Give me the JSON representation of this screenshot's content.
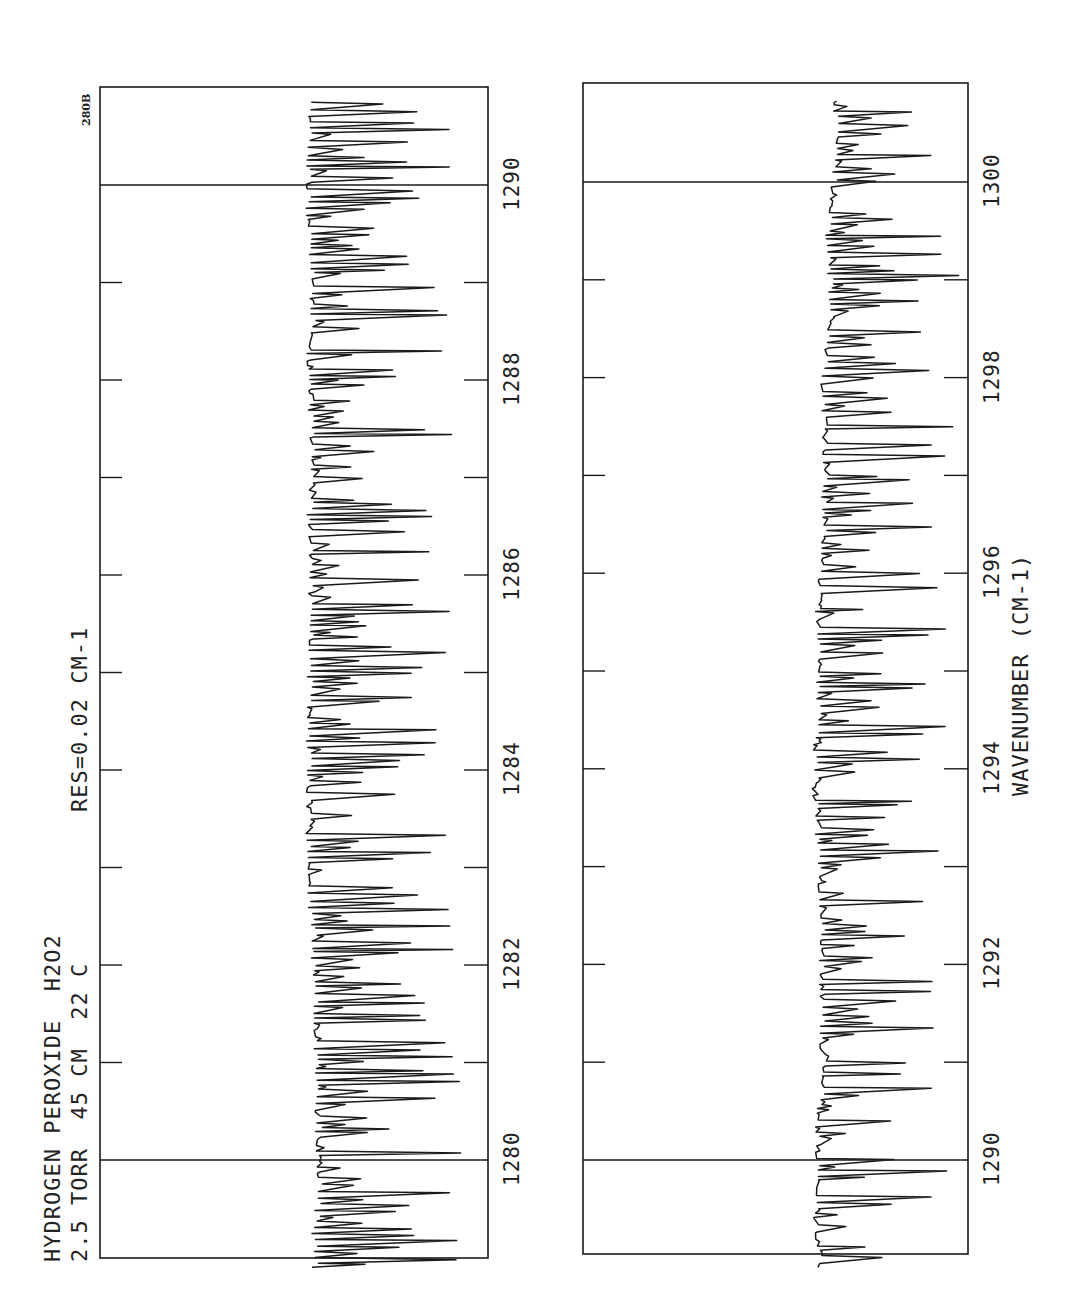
{
  "header": {
    "title_line1": "HYDROGEN PEROXIDE  H2O2",
    "title_line2": "2.5 TORR  45 CM  22 C",
    "resolution": "RES=0.02 CM-1",
    "plate_id": "280B",
    "xlabel": "WAVENUMBER (CM-1)"
  },
  "style": {
    "ink": "#1a1a1a",
    "background": "#ffffff"
  },
  "chart_data": [
    {
      "type": "line",
      "title": "HYDROGEN PEROXIDE H2O2, 2.5 TORR 45 CM 22 C, RES=0.02 CM-1",
      "xlabel": "WAVENUMBER (CM-1)",
      "ylabel": "Transmittance (arbitrary)",
      "xlim": [
        1278.9,
        1290.8
      ],
      "ylim": [
        0,
        1
      ],
      "orientation": "rotated-90 (wavenumber increases upward)",
      "major_ticks": [
        1280,
        1282,
        1284,
        1286,
        1288,
        1290
      ],
      "minor_ticks": [
        1281,
        1283,
        1285,
        1287,
        1289
      ],
      "tick_labels": [
        "1280",
        "1282",
        "1284",
        "1286",
        "1288",
        "1290"
      ],
      "reference_lines": [
        1280,
        1290
      ],
      "baseline": 0.55,
      "seed": 7,
      "box": {
        "x0": 100,
        "x1": 488,
        "y_top": 87,
        "y_bottom": 1258
      },
      "axis_map": {
        "w_ref": 1280,
        "y_ref": 1160,
        "px_per_unit": 97.5
      },
      "trace_x_range": [
        306,
        462
      ],
      "grid": false,
      "legend": null
    },
    {
      "type": "line",
      "title": "HYDROGEN PEROXIDE H2O2 (continued)",
      "xlabel": "WAVENUMBER (CM-1)",
      "ylabel": "Transmittance (arbitrary)",
      "xlim": [
        1288.9,
        1300.8
      ],
      "ylim": [
        0,
        1
      ],
      "orientation": "rotated-90 (wavenumber increases upward)",
      "major_ticks": [
        1290,
        1292,
        1294,
        1296,
        1298,
        1300
      ],
      "minor_ticks": [
        1291,
        1293,
        1295,
        1297,
        1299
      ],
      "tick_labels": [
        "1290",
        "1292",
        "1294",
        "1296",
        "1298",
        "1300"
      ],
      "reference_lines": [
        1290,
        1300
      ],
      "baseline": 0.62,
      "seed": 13,
      "box": {
        "x0": 583,
        "x1": 968,
        "y_top": 83,
        "y_bottom": 1254
      },
      "axis_map": {
        "w_ref": 1290,
        "y_ref": 1160,
        "px_per_unit": 97.8
      },
      "trace_x_range": [
        812,
        955
      ],
      "grid": false,
      "legend": null
    }
  ]
}
